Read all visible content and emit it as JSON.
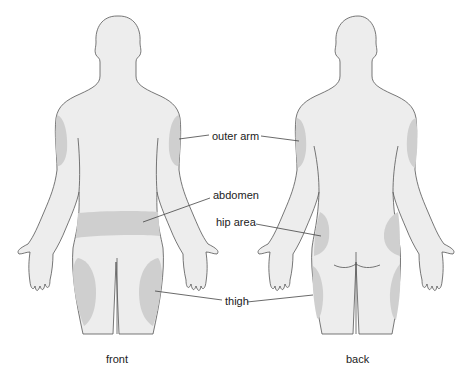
{
  "colors": {
    "body_fill": "#ededed",
    "body_outline": "#555555",
    "site_fill": "#cfcfcf",
    "leader_line": "#444444",
    "text": "#222222"
  },
  "labels": {
    "outer_arm": "outer arm",
    "abdomen": "abdomen",
    "hip_area": "hip area",
    "thigh": "thigh"
  },
  "captions": {
    "front": "front",
    "back": "back"
  }
}
